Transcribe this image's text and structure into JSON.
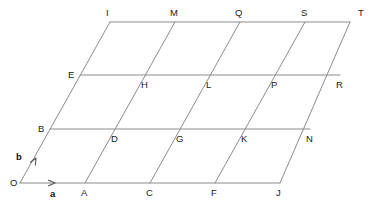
{
  "figure": {
    "background_color": "#ffffff",
    "line_color": "#8c8c8c",
    "label_color": "#1b1b1b",
    "line_width": 1
  },
  "basis": {
    "origin_label": "O",
    "a_label": "a",
    "b_label": "b",
    "a_vector_px": [
      65,
      0
    ],
    "b_vector_px": [
      30,
      -54
    ]
  },
  "grid": {
    "columns": 5,
    "rows": 3
  },
  "points": [
    {
      "label": "O",
      "x": 20,
      "y": 183,
      "lx": 10,
      "ly": 178
    },
    {
      "label": "A",
      "x": 85,
      "y": 183,
      "lx": 81,
      "ly": 188
    },
    {
      "label": "C",
      "x": 150,
      "y": 183,
      "lx": 146,
      "ly": 188
    },
    {
      "label": "F",
      "x": 215,
      "y": 183,
      "lx": 211,
      "ly": 188
    },
    {
      "label": "J",
      "x": 280,
      "y": 183,
      "lx": 276,
      "ly": 188
    },
    {
      "label": "B",
      "x": 50,
      "y": 129,
      "lx": 38,
      "ly": 124
    },
    {
      "label": "D",
      "x": 115,
      "y": 129,
      "lx": 111,
      "ly": 134
    },
    {
      "label": "G",
      "x": 180,
      "y": 129,
      "lx": 176,
      "ly": 134
    },
    {
      "label": "K",
      "x": 245,
      "y": 129,
      "lx": 241,
      "ly": 134
    },
    {
      "label": "N",
      "x": 310,
      "y": 129,
      "lx": 306,
      "ly": 134
    },
    {
      "label": "E",
      "x": 80,
      "y": 75,
      "lx": 68,
      "ly": 70
    },
    {
      "label": "H",
      "x": 145,
      "y": 75,
      "lx": 141,
      "ly": 80
    },
    {
      "label": "L",
      "x": 210,
      "y": 75,
      "lx": 206,
      "ly": 80
    },
    {
      "label": "P",
      "x": 275,
      "y": 75,
      "lx": 271,
      "ly": 80
    },
    {
      "label": "R",
      "x": 340,
      "y": 75,
      "lx": 336,
      "ly": 80
    },
    {
      "label": "I",
      "x": 110,
      "y": 22,
      "lx": 106,
      "ly": 8
    },
    {
      "label": "M",
      "x": 175,
      "y": 22,
      "lx": 170,
      "ly": 8
    },
    {
      "label": "Q",
      "x": 240,
      "y": 22,
      "lx": 235,
      "ly": 8
    },
    {
      "label": "S",
      "x": 305,
      "y": 22,
      "lx": 301,
      "ly": 8
    },
    {
      "label": "T",
      "x": 350,
      "y": 22,
      "lx": 358,
      "ly": 8
    }
  ],
  "segments": {
    "horizontal": [
      {
        "name": "bottom-row-line",
        "x1": 20,
        "y1": 183,
        "x2": 280,
        "y2": 183
      },
      {
        "name": "row-1-line",
        "x1": 50,
        "y1": 129,
        "x2": 310,
        "y2": 129
      },
      {
        "name": "row-2-line",
        "x1": 80,
        "y1": 75,
        "x2": 340,
        "y2": 75
      },
      {
        "name": "top-row-line",
        "x1": 110,
        "y1": 22,
        "x2": 350,
        "y2": 22
      }
    ],
    "diagonal": [
      {
        "name": "diagonal-O-I",
        "x1": 20,
        "y1": 183,
        "x2": 110,
        "y2": 22
      },
      {
        "name": "diagonal-A-M",
        "x1": 85,
        "y1": 183,
        "x2": 175,
        "y2": 22
      },
      {
        "name": "diagonal-C-Q",
        "x1": 150,
        "y1": 183,
        "x2": 240,
        "y2": 22
      },
      {
        "name": "diagonal-F-S",
        "x1": 215,
        "y1": 183,
        "x2": 305,
        "y2": 22
      },
      {
        "name": "diagonal-J-T",
        "x1": 280,
        "y1": 183,
        "x2": 350,
        "y2": 22
      }
    ]
  },
  "arrows": {
    "a_arrow": {
      "name": "vector-a-arrow",
      "x": 55,
      "y": 183,
      "angle_deg": 0,
      "label_x": 50,
      "label_y": 189
    },
    "b_arrow": {
      "name": "vector-b-arrow",
      "x": 36,
      "y": 158,
      "angle_deg": -61,
      "label_x": 16,
      "label_y": 152
    }
  }
}
